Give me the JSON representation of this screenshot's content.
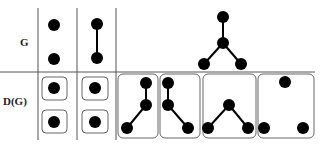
{
  "labels": {
    "row_top": "G",
    "row_bottom": "D(G)"
  },
  "colors": {
    "node": "#000000",
    "line": "#333333",
    "box": "#555555"
  },
  "columns": [
    {
      "id": "c1",
      "G": "two isolated vertices",
      "D(G)": "two single-vertex components"
    },
    {
      "id": "c2",
      "G": "single edge (2 vertices)",
      "D(G)": "two single-vertex components"
    },
    {
      "id": "c3",
      "G": "star with 4 vertices",
      "D(G)": "four 3-vertex subgraphs: two paths, one path (V shape), three isolated vertices"
    }
  ]
}
